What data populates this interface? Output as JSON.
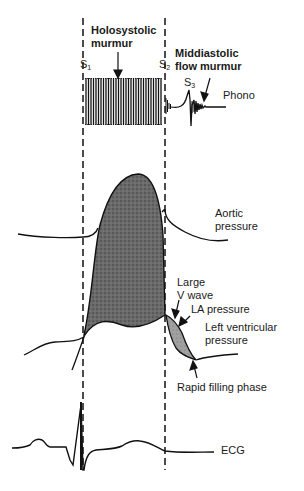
{
  "diagram": {
    "markers": {
      "s1": "S",
      "s1_sub": "1",
      "s2": "S",
      "s2_sub": "2",
      "s3": "S",
      "s3_sub": "3"
    },
    "labels": {
      "holosystolic_line1": "Holosystolic",
      "holosystolic_line2": "murmur",
      "middiastolic_line1": "Middiastolic",
      "middiastolic_line2": "flow murmur",
      "phono": "Phono",
      "aortic_line1": "Aortic",
      "aortic_line2": "pressure",
      "large_v_line1": "Large",
      "large_v_line2": "V wave",
      "la_pressure": "LA pressure",
      "lv_line1": "Left ventricular",
      "lv_line2": "pressure",
      "rapid_filling": "Rapid filling phase",
      "ecg": "ECG"
    },
    "colors": {
      "ink": "#111111",
      "shade_dark": "#5a5a5a",
      "shade_light": "#9a9a9a",
      "background": "#ffffff"
    }
  }
}
